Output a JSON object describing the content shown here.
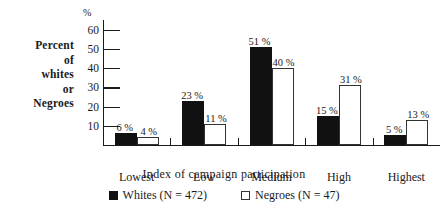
{
  "chart_data": {
    "type": "bar",
    "title": "",
    "xlabel": "Index of campaign participation",
    "ylabel": "Percent of whites or Negroes",
    "ylabel_lines": [
      "Percent",
      "of",
      "whites",
      "or",
      "Negroes"
    ],
    "y_unit": "%",
    "ylim": [
      0,
      65
    ],
    "yticks": [
      10,
      20,
      30,
      40,
      50,
      60
    ],
    "ytick_labels": [
      "10",
      "20",
      "30",
      "40",
      "50",
      "60"
    ],
    "grid": false,
    "legend_position": "bottom-center",
    "categories": [
      "Lowest",
      "Low",
      "Medium",
      "High",
      "Highest"
    ],
    "series": [
      {
        "name": "Whites (N = 472)",
        "short_name": "Whites",
        "n": 472,
        "color": "#111111",
        "style": "filled",
        "values": [
          6,
          23,
          51,
          15,
          5
        ],
        "value_labels": [
          "6 %",
          "23 %",
          "51 %",
          "15 %",
          "5 %"
        ]
      },
      {
        "name": "Negroes (N = 47)",
        "short_name": "Negroes",
        "n": 47,
        "color": "#ffffff",
        "style": "open",
        "values": [
          4,
          11,
          40,
          31,
          13
        ],
        "value_labels": [
          "4 %",
          "11 %",
          "40 %",
          "31 %",
          "13 %"
        ]
      }
    ]
  },
  "legend": {
    "items": [
      {
        "label": "Whites (N  =  472)",
        "style": "filled"
      },
      {
        "label": "Negroes (N  =  47)",
        "style": "open"
      }
    ]
  },
  "axis": {
    "x_title": "Index of campaign participation",
    "y_unit": "%"
  },
  "colors": {
    "ink": "#1a1a1a",
    "whites_bar": "#111111",
    "negroes_bar": "#ffffff",
    "negroes_bar_outline": "#333333",
    "background": "#ffffff"
  }
}
